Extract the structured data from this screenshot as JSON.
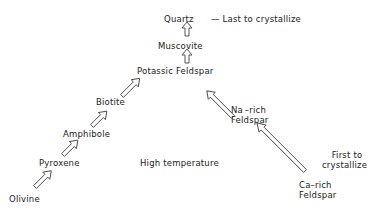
{
  "diagram": {
    "minerals": {
      "quartz": "Quartz",
      "muscovite": "Muscovite",
      "potassic_feldspar": "Potassic Feldspar",
      "biotite": "Biotite",
      "amphibole": "Amphibole",
      "pyroxene": "Pyroxene",
      "olivine": "Olivine",
      "na_rich_feldspar_1": "Na –rich",
      "na_rich_feldspar_2": "Feldspar",
      "ca_rich_feldspar_1": "Ca–rich",
      "ca_rich_feldspar_2": "Feldspar"
    },
    "annotations": {
      "last": "—  Last to crystallize",
      "high_temp": "High temperature",
      "first_1": "First to",
      "first_2": "crystallize"
    },
    "colors": {
      "line": "#444444",
      "text": "#222222",
      "background": "#ffffff"
    }
  }
}
